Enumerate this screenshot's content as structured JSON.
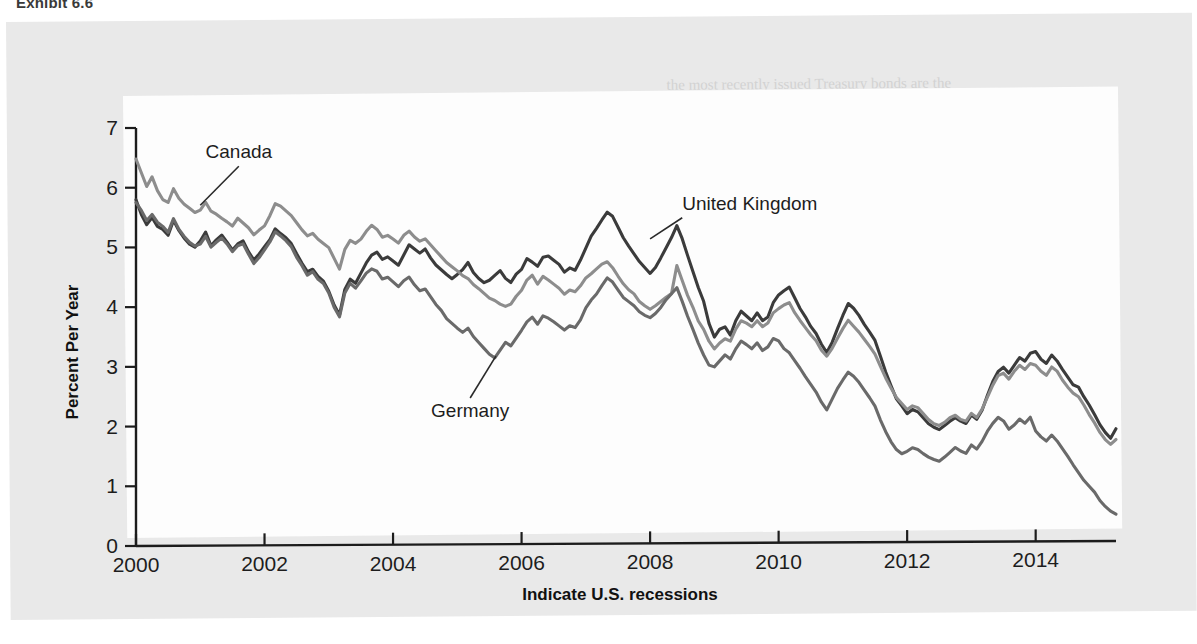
{
  "exhibit": {
    "title": "Exhibit 6.6"
  },
  "chart_data": {
    "type": "line",
    "title": "",
    "xlabel": "Indicate U.S. recessions",
    "ylabel": "Percent Per Year",
    "xlim": [
      2000,
      2015.25
    ],
    "ylim": [
      0,
      7
    ],
    "xticks": [
      "2000",
      "2002",
      "2004",
      "2006",
      "2008",
      "2010",
      "2012",
      "2014"
    ],
    "xtick_values": [
      2000,
      2002,
      2004,
      2006,
      2008,
      2010,
      2012,
      2014
    ],
    "yticks": [
      "0",
      "1",
      "2",
      "3",
      "4",
      "5",
      "6",
      "7"
    ],
    "ytick_values": [
      0,
      1,
      2,
      3,
      4,
      5,
      6,
      7
    ],
    "grid": false,
    "legend": "inline-annotations",
    "annotations": [
      {
        "text": "Canada",
        "x": 2001.6,
        "y": 6.35,
        "anchor_x": 2001.0,
        "anchor_y": 5.7
      },
      {
        "text": "United Kingdom",
        "x": 2008.5,
        "y": 5.45,
        "anchor_x": 2008.0,
        "anchor_y": 5.1
      },
      {
        "text": "Germany",
        "x": 2005.2,
        "y": 2.45,
        "anchor_x": 2005.6,
        "anchor_y": 3.15
      }
    ],
    "series": [
      {
        "name": "United Kingdom",
        "color": "#3b3b3b",
        "x_start": 2000,
        "x_step": 0.08333,
        "values": [
          5.8,
          5.55,
          5.38,
          5.5,
          5.35,
          5.3,
          5.2,
          5.45,
          5.28,
          5.15,
          5.05,
          5.0,
          5.1,
          5.25,
          5.02,
          5.12,
          5.2,
          5.08,
          4.95,
          5.05,
          5.1,
          4.92,
          4.78,
          4.88,
          5.0,
          5.12,
          5.3,
          5.22,
          5.15,
          5.05,
          4.88,
          4.72,
          4.58,
          4.62,
          4.5,
          4.42,
          4.25,
          4.02,
          3.85,
          4.28,
          4.45,
          4.38,
          4.55,
          4.72,
          4.85,
          4.9,
          4.78,
          4.82,
          4.75,
          4.68,
          4.85,
          5.02,
          4.95,
          4.88,
          4.95,
          4.8,
          4.68,
          4.6,
          4.52,
          4.45,
          4.52,
          4.6,
          4.72,
          4.55,
          4.45,
          4.38,
          4.42,
          4.5,
          4.58,
          4.45,
          4.38,
          4.52,
          4.6,
          4.78,
          4.72,
          4.65,
          4.8,
          4.82,
          4.75,
          4.68,
          4.55,
          4.62,
          4.58,
          4.75,
          4.95,
          5.15,
          5.28,
          5.42,
          5.55,
          5.48,
          5.3,
          5.12,
          4.98,
          4.85,
          4.72,
          4.62,
          4.52,
          4.62,
          4.78,
          4.95,
          5.12,
          5.32,
          5.1,
          4.82,
          4.55,
          4.28,
          4.05,
          3.68,
          3.45,
          3.58,
          3.62,
          3.48,
          3.72,
          3.88,
          3.8,
          3.72,
          3.85,
          3.72,
          3.78,
          4.02,
          4.15,
          4.22,
          4.28,
          4.1,
          3.92,
          3.78,
          3.62,
          3.5,
          3.32,
          3.18,
          3.35,
          3.58,
          3.8,
          4.0,
          3.92,
          3.8,
          3.65,
          3.52,
          3.38,
          3.12,
          2.85,
          2.62,
          2.4,
          2.28,
          2.15,
          2.22,
          2.18,
          2.08,
          1.98,
          1.92,
          1.88,
          1.95,
          2.02,
          2.08,
          2.02,
          1.98,
          2.12,
          2.05,
          2.2,
          2.45,
          2.68,
          2.85,
          2.92,
          2.82,
          2.95,
          3.08,
          3.02,
          3.15,
          3.18,
          3.05,
          2.98,
          3.12,
          3.02,
          2.88,
          2.75,
          2.62,
          2.58,
          2.42,
          2.28,
          2.12,
          1.95,
          1.82,
          1.72,
          1.88,
          2.05
        ]
      },
      {
        "name": "Canada",
        "color": "#8d8d8d",
        "x_start": 2000,
        "x_step": 0.08333,
        "values": [
          6.48,
          6.25,
          6.02,
          6.18,
          5.95,
          5.8,
          5.75,
          5.98,
          5.82,
          5.72,
          5.65,
          5.58,
          5.62,
          5.75,
          5.6,
          5.55,
          5.48,
          5.42,
          5.35,
          5.48,
          5.4,
          5.32,
          5.2,
          5.28,
          5.35,
          5.52,
          5.72,
          5.68,
          5.6,
          5.52,
          5.4,
          5.28,
          5.18,
          5.22,
          5.12,
          5.05,
          4.98,
          4.8,
          4.62,
          4.95,
          5.1,
          5.05,
          5.12,
          5.25,
          5.35,
          5.28,
          5.15,
          5.18,
          5.12,
          5.05,
          5.18,
          5.25,
          5.15,
          5.08,
          5.12,
          5.02,
          4.92,
          4.82,
          4.72,
          4.65,
          4.58,
          4.5,
          4.45,
          4.35,
          4.28,
          4.2,
          4.12,
          4.08,
          4.02,
          3.98,
          4.02,
          4.15,
          4.25,
          4.42,
          4.5,
          4.35,
          4.48,
          4.42,
          4.35,
          4.28,
          4.18,
          4.25,
          4.22,
          4.32,
          4.45,
          4.52,
          4.6,
          4.68,
          4.72,
          4.62,
          4.48,
          4.35,
          4.25,
          4.18,
          4.05,
          3.98,
          3.92,
          3.98,
          4.05,
          4.12,
          4.18,
          4.65,
          4.4,
          4.15,
          3.95,
          3.72,
          3.58,
          3.38,
          3.25,
          3.35,
          3.42,
          3.38,
          3.58,
          3.72,
          3.68,
          3.62,
          3.72,
          3.62,
          3.68,
          3.85,
          3.92,
          3.98,
          4.02,
          3.85,
          3.72,
          3.6,
          3.48,
          3.38,
          3.22,
          3.12,
          3.25,
          3.42,
          3.58,
          3.72,
          3.62,
          3.52,
          3.4,
          3.28,
          3.15,
          2.95,
          2.75,
          2.58,
          2.42,
          2.32,
          2.22,
          2.28,
          2.25,
          2.15,
          2.05,
          1.98,
          1.95,
          2.0,
          2.08,
          2.12,
          2.05,
          2.02,
          2.15,
          2.08,
          2.22,
          2.42,
          2.62,
          2.78,
          2.82,
          2.72,
          2.85,
          2.95,
          2.88,
          2.98,
          2.95,
          2.85,
          2.78,
          2.92,
          2.85,
          2.7,
          2.58,
          2.48,
          2.42,
          2.28,
          2.12,
          1.98,
          1.82,
          1.7,
          1.62,
          1.7,
          1.65
        ]
      },
      {
        "name": "Germany",
        "color": "#6a6a6a",
        "x_start": 2000,
        "x_step": 0.08333,
        "values": [
          5.75,
          5.62,
          5.45,
          5.55,
          5.42,
          5.35,
          5.25,
          5.48,
          5.3,
          5.18,
          5.08,
          5.02,
          5.05,
          5.18,
          5.0,
          5.08,
          5.15,
          5.05,
          4.92,
          5.02,
          5.05,
          4.88,
          4.72,
          4.82,
          4.95,
          5.08,
          5.25,
          5.18,
          5.1,
          5.0,
          4.82,
          4.68,
          4.52,
          4.58,
          4.45,
          4.38,
          4.22,
          3.98,
          3.82,
          4.22,
          4.38,
          4.3,
          4.42,
          4.55,
          4.62,
          4.58,
          4.45,
          4.48,
          4.4,
          4.32,
          4.42,
          4.48,
          4.35,
          4.25,
          4.28,
          4.15,
          4.02,
          3.92,
          3.78,
          3.7,
          3.62,
          3.55,
          3.62,
          3.48,
          3.38,
          3.28,
          3.18,
          3.12,
          3.25,
          3.38,
          3.32,
          3.45,
          3.58,
          3.72,
          3.8,
          3.68,
          3.82,
          3.78,
          3.72,
          3.65,
          3.58,
          3.65,
          3.62,
          3.75,
          3.95,
          4.08,
          4.18,
          4.32,
          4.45,
          4.38,
          4.25,
          4.12,
          4.05,
          3.98,
          3.88,
          3.82,
          3.78,
          3.85,
          3.95,
          4.08,
          4.18,
          4.28,
          4.05,
          3.8,
          3.58,
          3.35,
          3.15,
          2.98,
          2.95,
          3.05,
          3.15,
          3.08,
          3.25,
          3.38,
          3.32,
          3.25,
          3.35,
          3.22,
          3.28,
          3.42,
          3.38,
          3.25,
          3.18,
          3.05,
          2.92,
          2.78,
          2.65,
          2.52,
          2.35,
          2.22,
          2.4,
          2.58,
          2.72,
          2.85,
          2.78,
          2.68,
          2.55,
          2.42,
          2.28,
          2.05,
          1.85,
          1.68,
          1.55,
          1.48,
          1.52,
          1.58,
          1.55,
          1.48,
          1.42,
          1.38,
          1.35,
          1.42,
          1.5,
          1.58,
          1.52,
          1.48,
          1.62,
          1.55,
          1.68,
          1.85,
          1.98,
          2.08,
          2.02,
          1.88,
          1.95,
          2.05,
          1.98,
          2.08,
          1.85,
          1.75,
          1.68,
          1.78,
          1.68,
          1.55,
          1.42,
          1.28,
          1.15,
          1.02,
          0.92,
          0.82,
          0.68,
          0.58,
          0.5,
          0.45,
          0.52
        ]
      }
    ]
  },
  "bleed_text": [
    {
      "text": "the most recently issued Treasury bonds are the",
      "x": 660,
      "y": 60
    },
    {
      "text": "may be reflected in a higher yield",
      "x": 690,
      "y": 84
    },
    {
      "text": "The interest rate on a bond is determined by supply and demand",
      "x": 520,
      "y": 150
    },
    {
      "text": "conditions in the market as well as the credit quality of the issuer",
      "x": 500,
      "y": 176
    },
    {
      "text": "bonds of the same maturity may trade at different yields when",
      "x": 530,
      "y": 202
    },
    {
      "text": "investors assess the relative risk of the issuing governments",
      "x": 520,
      "y": 228
    },
    {
      "text": "over the period shown, long-term government bond yields",
      "x": 540,
      "y": 254
    },
    {
      "text": "declined substantially in all of the major industrial countries",
      "x": 520,
      "y": 280
    },
    {
      "text": "reflecting both lower inflation expectations and the aggressive",
      "x": 520,
      "y": 306
    },
    {
      "text": "monetary policy easing that followed the financial crisis",
      "x": 540,
      "y": 332
    },
    {
      "text": "Global Bond Strategy",
      "x": 590,
      "y": 428
    },
    {
      "text": "investors who purchase foreign bonds must consider",
      "x": 540,
      "y": 462
    }
  ]
}
